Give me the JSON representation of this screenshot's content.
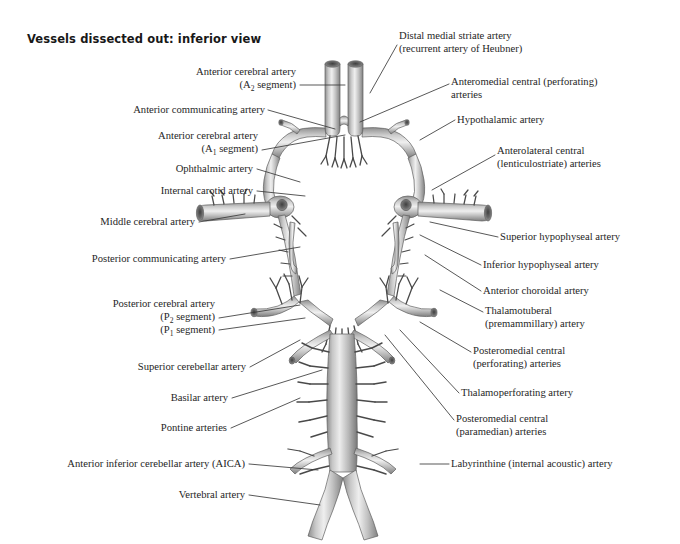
{
  "figure": {
    "title": "Vessels dissected out: inferior view",
    "background_color": "#ffffff",
    "text_color": "#262626",
    "leader_color": "#3a3a3a",
    "vessel_fill_light": "#e8e8e8",
    "vessel_fill_mid": "#b9b9b9",
    "vessel_fill_dark": "#7d7d7d",
    "vessel_outline": "#5a5a5a"
  },
  "labels_left": [
    {
      "id": "anterior-cerebral-a2",
      "lines": [
        "Anterior cerebral artery",
        "(A<sub>2</sub> segment)"
      ],
      "x": 296,
      "y": 66,
      "align": "right",
      "leader": [
        [
          300,
          85
        ],
        [
          345,
          85
        ]
      ]
    },
    {
      "id": "anterior-communicating",
      "lines": [
        "Anterior communicating artery"
      ],
      "x": 265,
      "y": 104,
      "align": "right",
      "leader": [
        [
          268,
          110
        ],
        [
          335,
          129
        ]
      ]
    },
    {
      "id": "anterior-cerebral-a1",
      "lines": [
        "Anterior cerebral artery",
        "(A<sub>1</sub> segment)"
      ],
      "x": 258,
      "y": 130,
      "align": "right",
      "leader": [
        [
          262,
          150
        ],
        [
          345,
          135
        ]
      ]
    },
    {
      "id": "ophthalmic-artery",
      "lines": [
        "Ophthalmic artery"
      ],
      "x": 253,
      "y": 163,
      "align": "right",
      "leader": [
        [
          257,
          169
        ],
        [
          300,
          182
        ]
      ]
    },
    {
      "id": "internal-carotid-artery",
      "lines": [
        "Internal carotid artery"
      ],
      "x": 253,
      "y": 185,
      "align": "right",
      "leader": [
        [
          257,
          191
        ],
        [
          305,
          196
        ]
      ]
    },
    {
      "id": "middle-cerebral-artery",
      "lines": [
        "Middle cerebral artery"
      ],
      "x": 195,
      "y": 216,
      "align": "right",
      "leader": [
        [
          199,
          222
        ],
        [
          245,
          214
        ]
      ]
    },
    {
      "id": "posterior-communicating-artery",
      "lines": [
        "Posterior communicating artery"
      ],
      "x": 226,
      "y": 253,
      "align": "right",
      "leader": [
        [
          230,
          259
        ],
        [
          300,
          247
        ]
      ]
    },
    {
      "id": "posterior-cerebral-p2",
      "lines": [
        "Posterior cerebral artery",
        "(P<sub>2</sub> segment)"
      ],
      "x": 215,
      "y": 298,
      "align": "right",
      "leader": [
        [
          219,
          318
        ],
        [
          300,
          305
        ]
      ]
    },
    {
      "id": "posterior-cerebral-p1",
      "lines": [
        "(P<sub>1</sub> segment)"
      ],
      "x": 215,
      "y": 324,
      "align": "right",
      "leader": [
        [
          219,
          330
        ],
        [
          305,
          318
        ]
      ]
    },
    {
      "id": "superior-cerebellar-artery",
      "lines": [
        "Superior cerebellar artery"
      ],
      "x": 246,
      "y": 361,
      "align": "right",
      "leader": [
        [
          250,
          367
        ],
        [
          300,
          340
        ]
      ]
    },
    {
      "id": "basilar-artery",
      "lines": [
        "Basilar artery"
      ],
      "x": 228,
      "y": 392,
      "align": "right",
      "leader": [
        [
          232,
          398
        ],
        [
          322,
          370
        ]
      ]
    },
    {
      "id": "pontine-arteries",
      "lines": [
        "Pontine arteries"
      ],
      "x": 227,
      "y": 422,
      "align": "right",
      "leader": [
        [
          231,
          428
        ],
        [
          300,
          398
        ]
      ]
    },
    {
      "id": "aica",
      "lines": [
        "Anterior inferior cerebellar artery (AICA)"
      ],
      "x": 245,
      "y": 458,
      "align": "right",
      "leader": [
        [
          249,
          464
        ],
        [
          318,
          470
        ]
      ]
    },
    {
      "id": "vertebral-artery",
      "lines": [
        "Vertebral artery"
      ],
      "x": 245,
      "y": 489,
      "align": "right",
      "leader": [
        [
          249,
          495
        ],
        [
          320,
          505
        ]
      ]
    }
  ],
  "labels_right": [
    {
      "id": "distal-medial-striate",
      "lines": [
        "Distal medial striate artery",
        "(recurrent artery of Heubner)"
      ],
      "x": 399,
      "y": 30,
      "align": "left",
      "leader": [
        [
          397,
          45
        ],
        [
          370,
          93
        ]
      ]
    },
    {
      "id": "anteromedial-central",
      "lines": [
        "Anteromedial central (perforating)",
        "arteries"
      ],
      "x": 451,
      "y": 76,
      "align": "left",
      "leader": [
        [
          449,
          84
        ],
        [
          360,
          122
        ]
      ]
    },
    {
      "id": "hypothalamic-artery",
      "lines": [
        "Hypothalamic artery"
      ],
      "x": 457,
      "y": 114,
      "align": "left",
      "leader": [
        [
          455,
          120
        ],
        [
          420,
          140
        ]
      ]
    },
    {
      "id": "anterolateral-central",
      "lines": [
        "Anterolateral central",
        "(lenticulostriate) arteries"
      ],
      "x": 497,
      "y": 145,
      "align": "left",
      "leader": [
        [
          495,
          155
        ],
        [
          432,
          190
        ]
      ]
    },
    {
      "id": "superior-hypophyseal",
      "lines": [
        "Superior hypophyseal artery"
      ],
      "x": 500,
      "y": 231,
      "align": "left",
      "leader": [
        [
          498,
          237
        ],
        [
          430,
          222
        ]
      ]
    },
    {
      "id": "inferior-hypophyseal",
      "lines": [
        "Inferior hypophyseal artery"
      ],
      "x": 483,
      "y": 259,
      "align": "left",
      "leader": [
        [
          481,
          265
        ],
        [
          420,
          235
        ]
      ]
    },
    {
      "id": "anterior-choroidal",
      "lines": [
        "Anterior choroidal artery"
      ],
      "x": 483,
      "y": 285,
      "align": "left",
      "leader": [
        [
          481,
          291
        ],
        [
          425,
          255
        ]
      ]
    },
    {
      "id": "thalamotuberal",
      "lines": [
        "Thalamotuberal",
        "(premammillary) artery"
      ],
      "x": 485,
      "y": 305,
      "align": "left",
      "leader": [
        [
          483,
          312
        ],
        [
          440,
          290
        ]
      ]
    },
    {
      "id": "posteromedial-central-perforating",
      "lines": [
        "Posteromedial central",
        "(perforating) arteries"
      ],
      "x": 473,
      "y": 345,
      "align": "left",
      "leader": [
        [
          471,
          352
        ],
        [
          420,
          322
        ]
      ]
    },
    {
      "id": "thalamoperforating",
      "lines": [
        "Thalamoperforating artery"
      ],
      "x": 461,
      "y": 387,
      "align": "left",
      "leader": [
        [
          459,
          393
        ],
        [
          400,
          330
        ]
      ]
    },
    {
      "id": "posteromedial-central-paramedian",
      "lines": [
        "Posteromedial central",
        "(paramedian) arteries"
      ],
      "x": 456,
      "y": 413,
      "align": "left",
      "leader": [
        [
          454,
          420
        ],
        [
          385,
          335
        ]
      ]
    },
    {
      "id": "labyrinthine-artery",
      "lines": [
        "Labyrinthine (internal acoustic) artery"
      ],
      "x": 451,
      "y": 458,
      "align": "left",
      "leader": [
        [
          449,
          464
        ],
        [
          420,
          464
        ]
      ]
    }
  ]
}
